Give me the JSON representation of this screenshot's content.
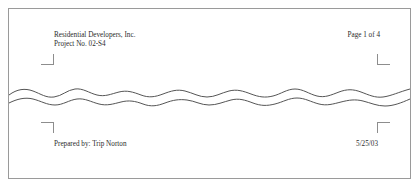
{
  "document": {
    "header": {
      "left_lines": [
        "Residential Developers, Inc.",
        "Project No.  02-S4"
      ],
      "right_text": "Page 1 of 4"
    },
    "footer": {
      "left_text": "Prepared by:  Trip Norton",
      "right_text": "5/25/03"
    },
    "marks": {
      "top_left": "corner-crop-mark",
      "top_right": "corner-crop-mark",
      "bottom_left": "corner-crop-mark",
      "bottom_right": "corner-crop-mark"
    },
    "break": {
      "style": "torn-paper-wavy-break"
    },
    "colors": {
      "text": "#2b2b2b",
      "border": "#9a9a9a",
      "mark": "#8d8d8d",
      "tear_line": "#555555",
      "page_background": "#ffffff"
    }
  }
}
